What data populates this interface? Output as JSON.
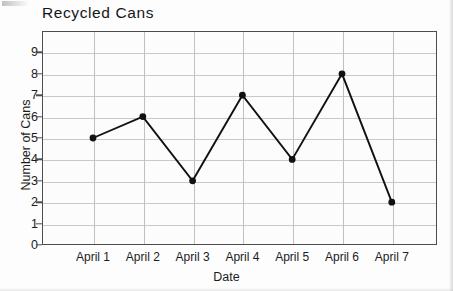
{
  "chart_data": {
    "type": "line",
    "title": "Recycled Cans",
    "xlabel": "Date",
    "ylabel": "Number of Cans",
    "categories": [
      "April 1",
      "April 2",
      "April 3",
      "April 4",
      "April 5",
      "April 6",
      "April 7"
    ],
    "values": [
      5,
      6,
      3,
      7,
      4,
      8,
      2
    ],
    "ytick_labels": [
      "0",
      "1",
      "2",
      "3",
      "4",
      "5",
      "6",
      "7",
      "8",
      "9"
    ],
    "ylim": [
      0,
      9.8
    ],
    "grid": "both",
    "legend": "none",
    "marker": "filled-circle",
    "line_color": "#111111",
    "marker_color": "#111111",
    "grid_color": "#c9c9c9",
    "frame_color": "#4d4d4d",
    "background_color": "#fcfcfc"
  }
}
